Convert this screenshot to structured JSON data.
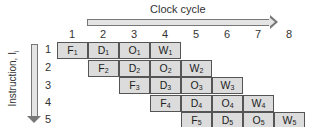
{
  "clock_axis": {
    "label": "Clock cycle",
    "cycles": [
      "1",
      "2",
      "3",
      "4",
      "5",
      "6",
      "7",
      "8"
    ]
  },
  "instruction_axis": {
    "label": "Instruction, I",
    "label_subscript": "i",
    "rows": [
      "1",
      "2",
      "3",
      "4",
      "5"
    ]
  },
  "stages": [
    "F",
    "D",
    "O",
    "W"
  ],
  "pipeline": [
    {
      "instruction": "1",
      "start_cycle": 1,
      "cells": [
        {
          "stage": "F",
          "sub": "1"
        },
        {
          "stage": "D",
          "sub": "1"
        },
        {
          "stage": "O",
          "sub": "1"
        },
        {
          "stage": "W",
          "sub": "1"
        }
      ]
    },
    {
      "instruction": "2",
      "start_cycle": 2,
      "cells": [
        {
          "stage": "F",
          "sub": "2"
        },
        {
          "stage": "D",
          "sub": "2"
        },
        {
          "stage": "O",
          "sub": "2"
        },
        {
          "stage": "W",
          "sub": "2"
        }
      ]
    },
    {
      "instruction": "3",
      "start_cycle": 3,
      "cells": [
        {
          "stage": "F",
          "sub": "3"
        },
        {
          "stage": "D",
          "sub": "3"
        },
        {
          "stage": "O",
          "sub": "3"
        },
        {
          "stage": "W",
          "sub": "3"
        }
      ]
    },
    {
      "instruction": "4",
      "start_cycle": 4,
      "cells": [
        {
          "stage": "F",
          "sub": "4"
        },
        {
          "stage": "D",
          "sub": "4"
        },
        {
          "stage": "O",
          "sub": "4"
        },
        {
          "stage": "W",
          "sub": "4"
        }
      ]
    },
    {
      "instruction": "5",
      "start_cycle": 5,
      "cells": [
        {
          "stage": "F",
          "sub": "5"
        },
        {
          "stage": "D",
          "sub": "5"
        },
        {
          "stage": "O",
          "sub": "5"
        },
        {
          "stage": "W",
          "sub": "5"
        }
      ]
    }
  ],
  "colors": {
    "cell_fill": "#dcdcdc",
    "cell_border": "#555555",
    "arrow_fill": "#e4e4e4"
  }
}
